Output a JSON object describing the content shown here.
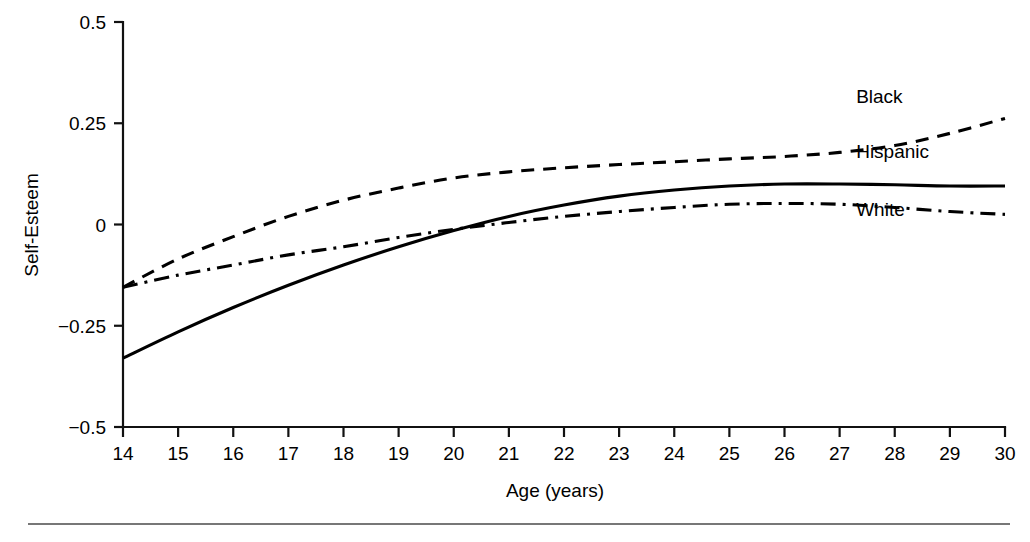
{
  "chart_data": {
    "type": "line",
    "title": "",
    "xlabel": "Age (years)",
    "ylabel": "Self-Esteem",
    "xlim": [
      14,
      30
    ],
    "ylim": [
      -0.5,
      0.5
    ],
    "grid": false,
    "legend_position": "inline-right",
    "x_ticks": [
      "14",
      "15",
      "16",
      "17",
      "18",
      "19",
      "20",
      "21",
      "22",
      "23",
      "24",
      "25",
      "26",
      "27",
      "28",
      "29",
      "30"
    ],
    "y_ticks": [
      "0.5",
      "0.25",
      "0",
      "−0.25",
      "−0.5"
    ],
    "x_tick_values": [
      14,
      15,
      16,
      17,
      18,
      19,
      20,
      21,
      22,
      23,
      24,
      25,
      26,
      27,
      28,
      29,
      30
    ],
    "y_tick_values": [
      0.5,
      0.25,
      0,
      -0.25,
      -0.5
    ],
    "x": [
      14,
      15,
      16,
      17,
      18,
      19,
      20,
      21,
      22,
      23,
      24,
      25,
      26,
      27,
      28,
      29,
      30
    ],
    "series": [
      {
        "name": "Black",
        "style": "dashed",
        "dasharray": "13,9",
        "label_x": 27.3,
        "label_y": 0.3,
        "values": [
          -0.155,
          -0.085,
          -0.03,
          0.02,
          0.06,
          0.09,
          0.115,
          0.13,
          0.14,
          0.148,
          0.155,
          0.162,
          0.168,
          0.178,
          0.195,
          0.225,
          0.262
        ]
      },
      {
        "name": "Hispanic",
        "style": "solid",
        "dasharray": "none",
        "label_x": 27.3,
        "label_y": 0.165,
        "values": [
          -0.33,
          -0.265,
          -0.205,
          -0.15,
          -0.1,
          -0.055,
          -0.015,
          0.02,
          0.048,
          0.07,
          0.085,
          0.095,
          0.1,
          0.1,
          0.098,
          0.095,
          0.095
        ]
      },
      {
        "name": "White",
        "style": "dash-dot",
        "dasharray": "15,7,3,7",
        "label_x": 27.3,
        "label_y": 0.02,
        "values": [
          -0.155,
          -0.125,
          -0.1,
          -0.075,
          -0.055,
          -0.032,
          -0.012,
          0.005,
          0.02,
          0.032,
          0.042,
          0.05,
          0.052,
          0.05,
          0.042,
          0.032,
          0.025
        ]
      }
    ]
  },
  "figure": {
    "footer_rule_visible": true
  }
}
